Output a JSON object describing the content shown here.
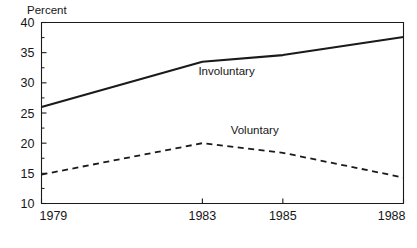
{
  "chart_data": {
    "type": "line",
    "title": "",
    "subtitle": "",
    "xlabel": "",
    "ylabel": "Percent",
    "ylim": [
      10,
      40
    ],
    "xlim": [
      1979,
      1988
    ],
    "grid": false,
    "legend_position": "inline-annotation",
    "y_ticks": [
      "40",
      "35",
      "30",
      "25",
      "20",
      "15",
      "10"
    ],
    "y_tick_values": [
      40,
      35,
      30,
      25,
      20,
      15,
      10
    ],
    "x_ticks": [
      "1979",
      "1983",
      "1985",
      "1988"
    ],
    "x_tick_values": [
      1979,
      1983,
      1985,
      1988
    ],
    "x": [
      1979,
      1983,
      1985,
      1988
    ],
    "series": [
      {
        "name": "Involuntary",
        "style": "solid",
        "color": "#1a1a1a",
        "values": [
          26.0,
          33.5,
          34.6,
          37.6
        ],
        "label": "Involuntary",
        "label_x": 1983.6,
        "label_y": 31.3
      },
      {
        "name": "Voluntary",
        "style": "dashed",
        "color": "#1a1a1a",
        "values": [
          14.8,
          20.0,
          18.4,
          14.3
        ],
        "label": "Voluntary",
        "label_x": 1984.3,
        "label_y": 21.6
      }
    ]
  },
  "axes": {
    "y_axis_title": "Percent"
  },
  "colors": {
    "ink": "#1a1a1a",
    "axis": "#1a1a1a",
    "background": "#ffffff"
  }
}
